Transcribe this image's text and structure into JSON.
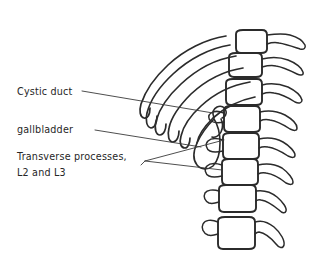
{
  "figure": {
    "kind": "hand-drawn-anatomy-sketch",
    "background_color": "#ffffff",
    "ink_color": "#2b2b2b",
    "width": 311,
    "height": 259
  },
  "labels": {
    "cystic_duct": "Cystic duct",
    "gallbladder": "gallbladder",
    "transverse_line1": "Transverse processes,",
    "transverse_line2": "L2 and L3"
  },
  "structures": {
    "vertebrae_count": 8,
    "rib_count": 6,
    "gallbladder_shape": "teardrop",
    "cystic_duct_shape": "short-hooked-tube"
  }
}
